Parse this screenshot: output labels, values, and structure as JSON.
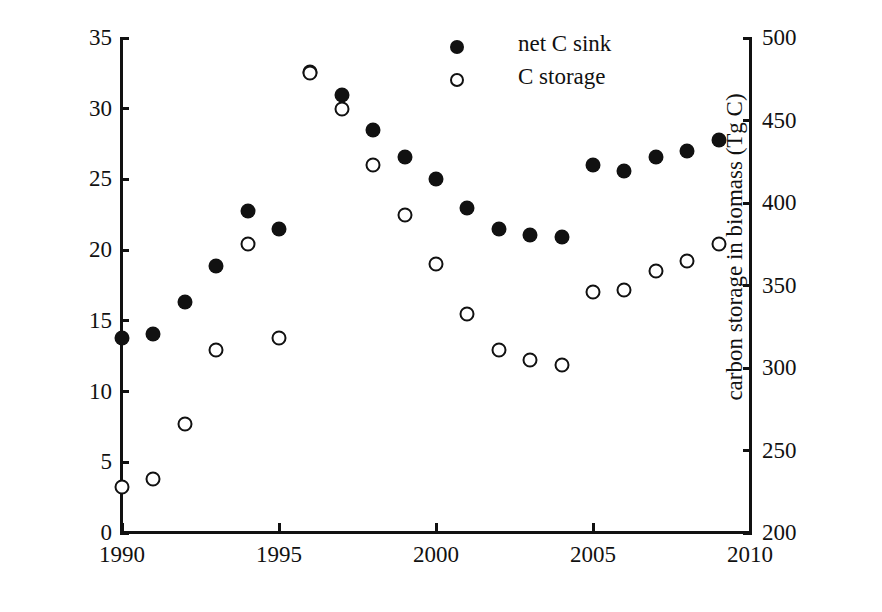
{
  "chart_data": {
    "type": "scatter",
    "title": "",
    "xlabel": "",
    "ylabel": "net carbon sink (Tg C/yr)",
    "y2label": "carbon storage in biomass (Tg C)",
    "xlim": [
      1990,
      2010
    ],
    "ylim": [
      0,
      35
    ],
    "y2lim": [
      200,
      500
    ],
    "xticks": [
      1990,
      1995,
      2000,
      2005,
      2010
    ],
    "xticklabels": [
      "1990",
      "1995",
      "2000",
      "2005",
      "2010"
    ],
    "yticks": [
      0,
      5,
      10,
      15,
      20,
      25,
      30,
      35
    ],
    "yticklabels": [
      "0",
      "5",
      "10",
      "15",
      "20",
      "25",
      "30",
      "35"
    ],
    "y2ticks": [
      200,
      250,
      300,
      350,
      400,
      450,
      500
    ],
    "y2ticklabels": [
      "200",
      "250",
      "300",
      "350",
      "400",
      "450",
      "500"
    ],
    "grid": false,
    "legend_position": "top-center",
    "x": [
      1990,
      1991,
      1992,
      1993,
      1994,
      1995,
      1996,
      1997,
      1998,
      1999,
      2000,
      2001,
      2002,
      2003,
      2004,
      2005,
      2006,
      2007,
      2008,
      2009
    ],
    "series": [
      {
        "name": "net C sink",
        "marker": "filled-circle",
        "color": "#111111",
        "axis": "left",
        "units": "Tg C/yr",
        "values": [
          13.8,
          14.1,
          16.3,
          18.9,
          22.8,
          21.5,
          32.6,
          31.0,
          28.5,
          26.6,
          25.0,
          23.0,
          21.5,
          21.1,
          20.9,
          26.0,
          25.6,
          26.6,
          27.0,
          27.8
        ]
      },
      {
        "name": "C storage",
        "marker": "open-circle",
        "color": "#111111",
        "axis": "right",
        "units": "Tg C",
        "values_left_axis_scale": [
          3.3,
          3.8,
          7.7,
          13.0,
          20.4,
          13.8,
          32.5,
          30.0,
          26.0,
          22.5,
          19.0,
          15.5,
          12.9,
          12.3,
          11.9,
          17.0,
          17.2,
          18.5,
          19.2,
          20.4
        ],
        "values": [
          228,
          233,
          266,
          311,
          375,
          318,
          479,
          457,
          423,
          393,
          363,
          333,
          311,
          305,
          302,
          346,
          347,
          359,
          365,
          375
        ]
      }
    ]
  },
  "legend": {
    "entries": [
      {
        "label": "net C sink",
        "marker": "filled-circle"
      },
      {
        "label": "C storage",
        "marker": "open-circle"
      }
    ]
  }
}
